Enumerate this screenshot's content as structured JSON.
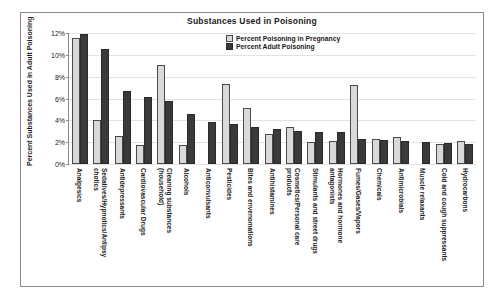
{
  "chart_data": {
    "type": "bar",
    "title": "Substances Used in Poisoning",
    "xlabel": "",
    "ylabel": "Percent Substances Used in\nAdult Poisoning",
    "ylim": [
      0,
      12
    ],
    "ytick_labels": [
      "12%",
      "10%",
      "8%",
      "6%",
      "4%",
      "2%",
      "0%"
    ],
    "ytick_values": [
      12,
      10,
      8,
      6,
      4,
      2,
      0
    ],
    "grid": true,
    "legend_position": "top-center",
    "categories": [
      "Analgesics",
      "Sedatives/Hypnotics/Antipsychotics",
      "Antidepressants",
      "Cardiovascular Drugs",
      "Cleaning substances (household)",
      "Alcohols",
      "Anticonvulsants",
      "Pesticides",
      "Bites and envenomations",
      "Antihistamines",
      "Cosmetics/Personal care products",
      "Stimulants and street drugs",
      "Hormones and hormone antagonists",
      "Fumes/Gases/Vapors",
      "Chemicals",
      "Antimicrobials",
      "Muscle relaxants",
      "Cold and cough suppressants",
      "Hydrocarbons"
    ],
    "series": [
      {
        "name": "Percent Poisoning in Pregnancy",
        "color": "#d9d9d9",
        "values": [
          11.5,
          4.0,
          2.6,
          1.7,
          9.1,
          1.7,
          null,
          7.3,
          5.1,
          2.75,
          3.35,
          2.0,
          2.1,
          7.2,
          2.3,
          2.5,
          null,
          1.85,
          2.1
        ]
      },
      {
        "name": "Percent Adult Poisoning",
        "color": "#3a3a3a",
        "values": [
          11.9,
          10.5,
          6.7,
          6.1,
          5.75,
          4.6,
          3.85,
          3.7,
          3.4,
          3.2,
          3.0,
          2.95,
          2.95,
          2.3,
          2.2,
          2.1,
          2.0,
          1.95,
          1.8
        ]
      }
    ]
  },
  "legend": {
    "items": [
      {
        "label": "Percent Poisoning in Pregnancy"
      },
      {
        "label": "Percent Adult Poisoning"
      }
    ]
  }
}
